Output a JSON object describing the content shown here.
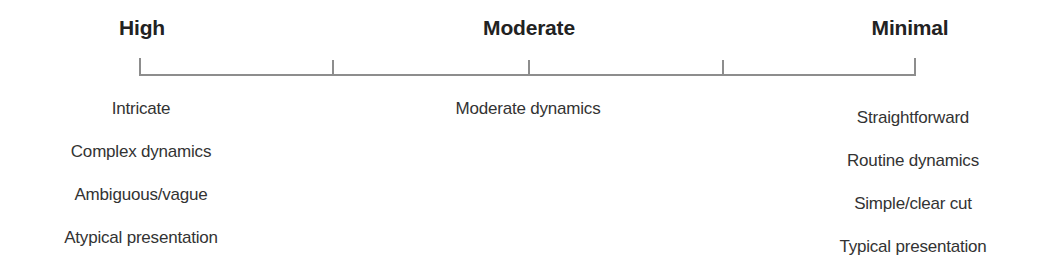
{
  "diagram": {
    "type": "spectrum-scale",
    "line_color": "#8d8d8d",
    "text_color": "#333333",
    "levels": [
      {
        "label": "High",
        "descriptors": [
          "Intricate",
          "Complex dynamics",
          "Ambiguous/vague",
          "Atypical presentation"
        ]
      },
      {
        "label": "Moderate",
        "descriptors": [
          "Moderate dynamics"
        ]
      },
      {
        "label": "Minimal",
        "descriptors": [
          "Straightforward",
          "Routine dynamics",
          "Simple/clear cut",
          "Typical presentation"
        ]
      }
    ],
    "tick_count": 5
  }
}
